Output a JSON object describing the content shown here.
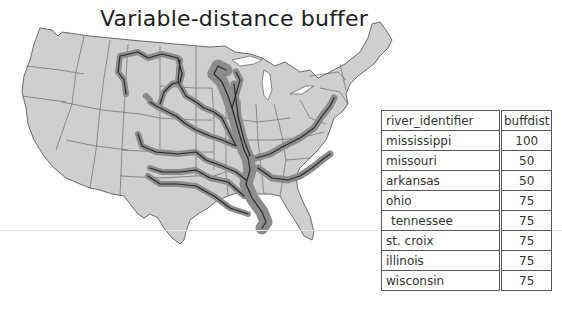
{
  "title": "Variable-distance buffer",
  "map": {
    "description": "Contiguous United States with state boundaries; rivers buffered by variable distance",
    "land_color": "#cfcfcf",
    "border_color": "#6a6a6a",
    "buffer_color": "#8c8c8c",
    "river_color": "#2a2a2a"
  },
  "table": {
    "headers": [
      "river_identifier",
      "buffdist"
    ],
    "rows": [
      {
        "river": "mississippi",
        "buffdist": "100"
      },
      {
        "river": "missouri",
        "buffdist": "50"
      },
      {
        "river": "arkansas",
        "buffdist": "50"
      },
      {
        "river": "ohio",
        "buffdist": "75"
      },
      {
        "river": "tennessee",
        "buffdist": "75"
      },
      {
        "river": "st. croix",
        "buffdist": "75"
      },
      {
        "river": "illinois",
        "buffdist": "75"
      },
      {
        "river": "wisconsin",
        "buffdist": "75"
      }
    ]
  }
}
